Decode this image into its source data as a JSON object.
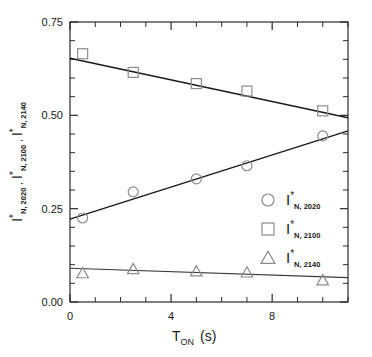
{
  "chart_data": {
    "type": "scatter",
    "title": "",
    "xlabel": "T_ON (s)",
    "xlabel_main": "T",
    "xlabel_sub": "ON",
    "xlabel_units": "(s)",
    "ylabel": "I*_N,2020 , I*_N,2100 , I*_N,2140",
    "xlim": [
      0,
      11
    ],
    "ylim": [
      0.0,
      0.75
    ],
    "xticks": [
      0,
      4,
      8
    ],
    "xtick_labels": [
      "0",
      "4",
      "8"
    ],
    "xminor_step": 1,
    "yticks": [
      0.0,
      0.25,
      0.5,
      0.75
    ],
    "ytick_labels": [
      "0.00",
      "0.25",
      "0.50",
      "0.75"
    ],
    "yminor_step": 0.05,
    "grid": false,
    "legend_position": "center-right",
    "x": [
      0.5,
      2.5,
      5.0,
      7.0,
      10.0
    ],
    "series": [
      {
        "name": "I*_N,2020",
        "marker": "circle",
        "values": [
          0.225,
          0.295,
          0.33,
          0.365,
          0.445
        ],
        "fit": {
          "intercept": 0.222,
          "slope": 0.0215
        },
        "legend_main": "I",
        "legend_star": "*",
        "legend_sub": "N, 2020"
      },
      {
        "name": "I*_N,2100",
        "marker": "square",
        "values": [
          0.665,
          0.615,
          0.585,
          0.565,
          0.512
        ],
        "fit": {
          "intercept": 0.653,
          "slope": -0.0145
        },
        "legend_main": "I",
        "legend_star": "*",
        "legend_sub": "N, 2100"
      },
      {
        "name": "I*_N,2140",
        "marker": "triangle",
        "values": [
          0.077,
          0.088,
          0.082,
          0.079,
          0.058
        ],
        "fit": {
          "intercept": 0.0905,
          "slope": -0.0023
        },
        "legend_main": "I",
        "legend_star": "*",
        "legend_sub": "N, 2140"
      }
    ]
  },
  "axes": {
    "y_label_parts": [
      {
        "main": "I",
        "star": "*",
        "sub": "N, 2020"
      },
      {
        "main": "I",
        "star": "*",
        "sub": "N, 2100"
      },
      {
        "main": "I",
        "star": "*",
        "sub": "N, 2140"
      }
    ],
    "separator": ","
  }
}
